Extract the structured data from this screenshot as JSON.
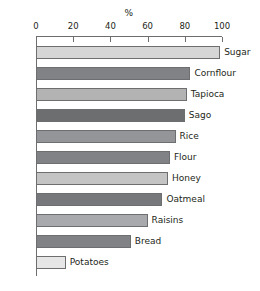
{
  "chart_data": {
    "type": "bar",
    "orientation": "horizontal",
    "title": "",
    "xlabel": "%",
    "ylabel": "",
    "xlim": [
      0,
      100
    ],
    "xticks": [
      0,
      20,
      40,
      60,
      80,
      100
    ],
    "xtick_labels": [
      "0",
      "20",
      "40",
      "60",
      "80",
      "100"
    ],
    "grid": false,
    "legend": "none",
    "categories": [
      "Sugar",
      "Cornflour",
      "Tapioca",
      "Sago",
      "Rice",
      "Flour",
      "Honey",
      "Oatmeal",
      "Raisins",
      "Bread",
      "Potatoes"
    ],
    "values": [
      99,
      83,
      81,
      80,
      75,
      72,
      71,
      68,
      60,
      51,
      16
    ],
    "bar_colors": [
      "#d6d6d6",
      "#808285",
      "#b3b3b3",
      "#6d6e70",
      "#949599",
      "#808285",
      "#c4c4c4",
      "#77787b",
      "#a7a9ac",
      "#808285",
      "#e6e6e6"
    ],
    "bar_border_color": "#6d6e70",
    "axis_color": "#6d6e70",
    "background": "#ffffff"
  }
}
